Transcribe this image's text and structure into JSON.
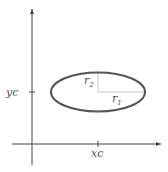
{
  "diagram": {
    "title": "",
    "colors": {
      "axis": "#444444",
      "ellipse": "#555555",
      "guide": "#bbbbbb",
      "text": "#555555"
    },
    "labels": {
      "xc": "xc",
      "yc": "yc",
      "r1_base": "r",
      "r1_sub": "1",
      "r2_base": "r",
      "r2_sub": "2"
    },
    "shapes": {
      "ellipse": {
        "cx": 98,
        "cy": 92,
        "rx": 48,
        "ry": 20
      },
      "x_axis": {
        "x1": 12,
        "x2": 162,
        "y": 144
      },
      "y_axis": {
        "x": 32,
        "y1": 8,
        "y2": 165
      }
    }
  }
}
